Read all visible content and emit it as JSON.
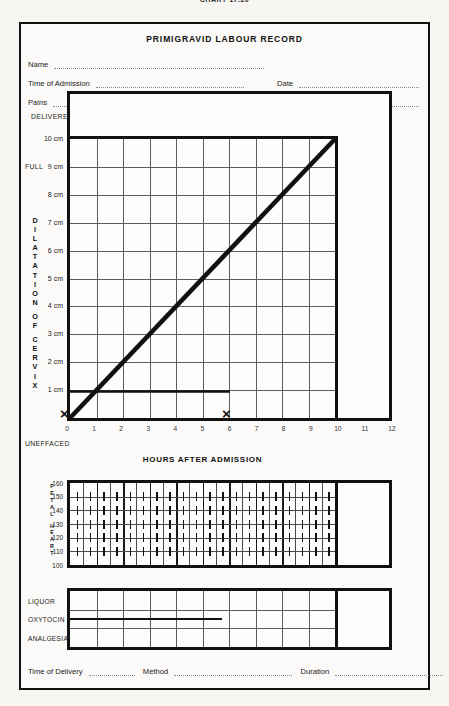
{
  "page_code": "CHART 17.20",
  "form": {
    "title": "PRIMIGRAVID LABOUR RECORD",
    "fields": [
      {
        "label": "Name"
      },
      {
        "label": "Time of Admission"
      },
      {
        "label": "Date"
      },
      {
        "label": "Pains"
      },
      {
        "label": "Show"
      },
      {
        "label": "Ruptured Membranes"
      }
    ],
    "footer": [
      {
        "label": "Time of Delivery"
      },
      {
        "label": "Method"
      },
      {
        "label": "Duration"
      }
    ]
  },
  "partograph": {
    "top_label": "DELIVERED",
    "full_label": "FULL",
    "bottom_label": "UNEFFACED",
    "vertical_caption": "DILATATION OF CERVIX",
    "y_ticks": [
      "10 cm",
      "9 cm",
      "8 cm",
      "7 cm",
      "6 cm",
      "5 cm",
      "4 cm",
      "3 cm",
      "2 cm",
      "1 cm"
    ],
    "x_label": "HOURS AFTER ADMISSION",
    "x_ticks": [
      "0",
      "1",
      "2",
      "3",
      "4",
      "5",
      "6",
      "7",
      "8",
      "9",
      "10",
      "11",
      "12"
    ],
    "marker_glyph": "×"
  },
  "fetal_heart": {
    "caption": "FETAL HEART",
    "y_ticks": [
      "160",
      "150",
      "140",
      "130",
      "120",
      "110",
      "100"
    ]
  },
  "bottom_panel": {
    "rows": [
      "LIQUOR",
      "OXYTOCIN",
      "ANALGESIA"
    ]
  },
  "chart_data": {
    "type": "line",
    "title": "PRIMIGRAVID LABOUR RECORD",
    "subtitle": "Partogram — cervical dilatation against hours after admission",
    "xlabel": "HOURS AFTER ADMISSION",
    "ylabel": "DILATATION OF CERVIX",
    "xlim": [
      0,
      12
    ],
    "ylim": [
      0,
      10
    ],
    "xticks": [
      0,
      1,
      2,
      3,
      4,
      5,
      6,
      7,
      8,
      9,
      10,
      11,
      12
    ],
    "yticks": [
      0,
      1,
      2,
      3,
      4,
      5,
      6,
      7,
      8,
      9,
      10
    ],
    "ytick_labels": [
      "UNEFFACED",
      "1 cm",
      "2 cm",
      "3 cm",
      "4 cm",
      "5 cm",
      "6 cm",
      "7 cm",
      "8 cm",
      "9 cm",
      "10 cm"
    ],
    "grid": true,
    "grid_x_range": [
      0,
      10
    ],
    "legend": "none",
    "annotations": [
      {
        "text": "DELIVERED",
        "position": "above-plot-left"
      },
      {
        "text": "FULL",
        "position": "left-of-10cm"
      },
      {
        "text": "UNEFFACED",
        "position": "left-of-0cm"
      }
    ],
    "series": [
      {
        "name": "Expected dilatation (1 cm per hour)",
        "type": "line",
        "x": [
          0,
          10
        ],
        "y": [
          0,
          10
        ],
        "style": "thick-solid-diagonal"
      },
      {
        "name": "Latent-phase marker line at 1 cm",
        "type": "line",
        "x": [
          0,
          6
        ],
        "y": [
          1,
          1
        ],
        "style": "solid-with-x-markers",
        "markers": [
          {
            "x": 0,
            "y": 1,
            "glyph": "×"
          },
          {
            "x": 6,
            "y": 1,
            "glyph": "×"
          }
        ]
      }
    ],
    "subcharts": [
      {
        "type": "grid",
        "title": "FETAL HEART",
        "ylim": [
          100,
          160
        ],
        "yticks": [
          100,
          110,
          120,
          130,
          140,
          150,
          160
        ],
        "xlim": [
          0,
          10
        ],
        "values": []
      },
      {
        "type": "table",
        "rows": [
          "LIQUOR",
          "OXYTOCIN",
          "ANALGESIA"
        ],
        "xlim": [
          0,
          10
        ],
        "series": [
          {
            "name": "OXYTOCIN",
            "type": "bar-span",
            "x_start": 0,
            "x_end": 5.5,
            "row": "OXYTOCIN"
          }
        ]
      }
    ]
  },
  "colors": {
    "ink": "#111111",
    "grid": "#5c5c5c",
    "paper": "#fbfaf8",
    "dotted": "#8a8a8a"
  }
}
